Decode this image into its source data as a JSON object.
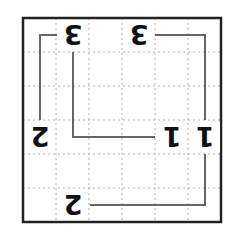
{
  "puzzle": {
    "rows": 6,
    "cols": 6,
    "orientation": "rotated-180",
    "grid": {
      "left": 23,
      "top": 18,
      "right": 221,
      "bottom": 222,
      "border_color": "#222222",
      "gridline_color": "#b0b0b0",
      "path_color": "#666666"
    },
    "clues": [
      {
        "row": 0,
        "col": 1,
        "value": "3"
      },
      {
        "row": 0,
        "col": 3,
        "value": "3"
      },
      {
        "row": 3,
        "col": 0,
        "value": "2"
      },
      {
        "row": 3,
        "col": 4,
        "value": "1"
      },
      {
        "row": 3,
        "col": 5,
        "value": "1"
      },
      {
        "row": 5,
        "col": 1,
        "value": "2"
      }
    ],
    "connections": [
      {
        "from": [
          0,
          1
        ],
        "to": [
          3,
          0
        ],
        "points": [
          [
            57,
            35
          ],
          [
            40,
            35
          ],
          [
            40,
            120
          ]
        ]
      },
      {
        "from": [
          0,
          1
        ],
        "to": [
          3,
          4
        ],
        "points": [
          [
            73,
            52
          ],
          [
            73,
            137
          ],
          [
            155,
            137
          ]
        ]
      },
      {
        "from": [
          0,
          3
        ],
        "to": [
          3,
          5
        ],
        "points": [
          [
            155,
            35
          ],
          [
            205,
            35
          ],
          [
            205,
            120
          ]
        ]
      },
      {
        "from": [
          3,
          5
        ],
        "to": [
          5,
          1
        ],
        "points": [
          [
            205,
            154
          ],
          [
            205,
            205
          ],
          [
            90,
            205
          ]
        ]
      }
    ]
  }
}
